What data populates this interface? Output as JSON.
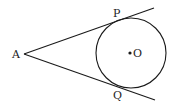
{
  "diagram": {
    "points": {
      "A": {
        "label": "A"
      },
      "P": {
        "label": "P"
      },
      "Q": {
        "label": "Q"
      },
      "O": {
        "label": "O"
      }
    },
    "elements": [
      {
        "type": "circle",
        "center": "O"
      },
      {
        "type": "tangent",
        "from": "A",
        "through": "P"
      },
      {
        "type": "tangent",
        "from": "A",
        "through": "Q"
      },
      {
        "type": "point",
        "name": "O"
      }
    ],
    "colors": {
      "stroke": "#1a1a1a",
      "text": "#222222",
      "background": "#ffffff"
    }
  }
}
